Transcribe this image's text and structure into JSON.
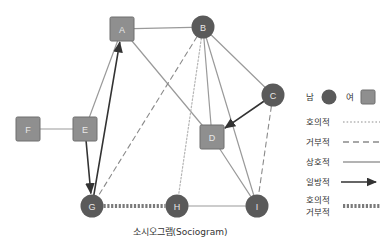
{
  "caption": "소시오그램(Sociogram)",
  "colors": {
    "male_node": "#5a5a5a",
    "female_node": "#8f8f8f",
    "female_node_border": "#6e6e6e",
    "node_label": "#e8e8e8",
    "edge_mutual": "#9a9a9a",
    "edge_favorable": "#b5b5b5",
    "edge_rejecting": "#8a8a8a",
    "edge_oneway": "#333333",
    "edge_both": "#7a7a7a",
    "text": "#333333",
    "background": "#ffffff"
  },
  "nodes": [
    {
      "id": "A",
      "label": "A",
      "gender": "female",
      "shape": "square",
      "x": 122,
      "y": 29
    },
    {
      "id": "B",
      "label": "B",
      "gender": "male",
      "shape": "circle",
      "x": 203,
      "y": 27
    },
    {
      "id": "C",
      "label": "C",
      "gender": "male",
      "shape": "circle",
      "x": 273,
      "y": 95
    },
    {
      "id": "D",
      "label": "D",
      "gender": "female",
      "shape": "square",
      "x": 212,
      "y": 137
    },
    {
      "id": "E",
      "label": "E",
      "gender": "female",
      "shape": "square",
      "x": 85,
      "y": 129
    },
    {
      "id": "F",
      "label": "F",
      "gender": "female",
      "shape": "square",
      "x": 28,
      "y": 129
    },
    {
      "id": "G",
      "label": "G",
      "gender": "male",
      "shape": "circle",
      "x": 92,
      "y": 206
    },
    {
      "id": "H",
      "label": "H",
      "gender": "male",
      "shape": "circle",
      "x": 177,
      "y": 206
    },
    {
      "id": "I",
      "label": "I",
      "gender": "male",
      "shape": "circle",
      "x": 257,
      "y": 206
    }
  ],
  "edges": [
    {
      "from": "A",
      "to": "B",
      "type": "mutual"
    },
    {
      "from": "A",
      "to": "E",
      "type": "mutual"
    },
    {
      "from": "A",
      "to": "D",
      "type": "mutual"
    },
    {
      "from": "B",
      "to": "C",
      "type": "mutual"
    },
    {
      "from": "B",
      "to": "D",
      "type": "mutual"
    },
    {
      "from": "B",
      "to": "I",
      "type": "mutual"
    },
    {
      "from": "B",
      "to": "G",
      "type": "rejecting"
    },
    {
      "from": "B",
      "to": "H",
      "type": "favorable"
    },
    {
      "from": "C",
      "to": "D",
      "type": "oneway"
    },
    {
      "from": "C",
      "to": "I",
      "type": "rejecting"
    },
    {
      "from": "D",
      "to": "I",
      "type": "mutual"
    },
    {
      "from": "E",
      "to": "F",
      "type": "mutual"
    },
    {
      "from": "E",
      "to": "G",
      "type": "oneway"
    },
    {
      "from": "G",
      "to": "A",
      "type": "oneway"
    },
    {
      "from": "G",
      "to": "H",
      "type": "favorable_rejecting"
    },
    {
      "from": "H",
      "to": "I",
      "type": "mutual"
    }
  ],
  "legend": {
    "gender": [
      {
        "label": "남",
        "shape": "circle",
        "meaning": "male"
      },
      {
        "label": "여",
        "shape": "square",
        "meaning": "female"
      }
    ],
    "lines": [
      {
        "label": "호의적",
        "style": "dotted"
      },
      {
        "label": "거부적",
        "style": "dashed"
      },
      {
        "label": "상호적",
        "style": "solid"
      },
      {
        "label": "일방적",
        "style": "arrow"
      },
      {
        "label": "호의적",
        "label2": "거부적",
        "style": "thick-dotted"
      }
    ]
  }
}
